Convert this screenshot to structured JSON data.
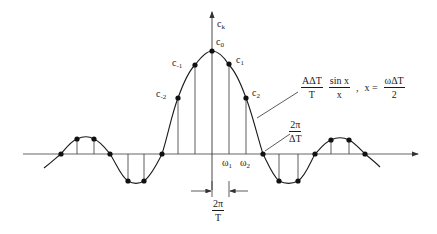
{
  "diagram": {
    "type": "sinc-spectrum-sampled",
    "axis": {
      "y_label_base": "c",
      "y_label_sub": "k"
    },
    "coefficient_labels": [
      {
        "base": "c",
        "sub": "0"
      },
      {
        "base": "c",
        "sub": "1"
      },
      {
        "base": "c",
        "sub": "-1"
      },
      {
        "base": "c",
        "sub": "2"
      },
      {
        "base": "c",
        "sub": "-2"
      }
    ],
    "frequency_labels": [
      {
        "base": "ω",
        "sub": "1"
      },
      {
        "base": "ω",
        "sub": "2"
      }
    ],
    "envelope_formula": {
      "frac1_num": "AΔT",
      "frac1_den": "T",
      "frac2_num": "sin x",
      "frac2_den": "x",
      "separator": ",",
      "x_eq": "x =",
      "frac3_num": "ωΔT",
      "frac3_den": "2"
    },
    "zero_crossing_label": {
      "num": "2π",
      "den": "ΔT"
    },
    "spacing_label": {
      "num": "2π",
      "den": "T"
    },
    "line_color": "#1a1a1a",
    "axis_color": "#555555"
  }
}
